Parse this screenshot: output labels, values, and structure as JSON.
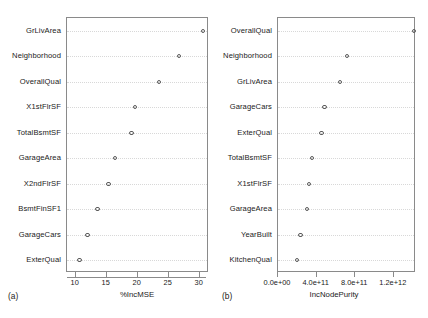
{
  "figure": {
    "background": "#ffffff",
    "marker_color": "#5a5a5a",
    "frame_color": "#8a8a8a",
    "guide_color": "#d8d8d8"
  },
  "panels": [
    {
      "tag": "(a)",
      "xlabel": "%IncMSE",
      "xticks": [
        "10",
        "15",
        "20",
        "25",
        "30"
      ]
    },
    {
      "tag": "(b)",
      "xlabel": "IncNodePurity",
      "xticks": [
        "0.0e+00",
        "4.0e+11",
        "8.0e+11",
        "1.2e+12"
      ]
    }
  ],
  "chart_data": [
    {
      "type": "scatter",
      "title": "(a)",
      "xlabel": "%IncMSE",
      "ylabel": "",
      "xlim": [
        8.6,
        31.5
      ],
      "xticks": [
        10,
        15,
        20,
        25,
        30
      ],
      "xticklabels": [
        "10",
        "15",
        "20",
        "25",
        "30"
      ],
      "grid": "dotted-horizontal",
      "legend": "none",
      "orientation": "horizontal-dotchart",
      "categories": [
        "GrLivArea",
        "Neighborhood",
        "OverallQual",
        "X1stFlrSF",
        "TotalBsmtSF",
        "GarageArea",
        "X2ndFlrSF",
        "BsmtFinSF1",
        "GarageCars",
        "ExterQual"
      ],
      "values": [
        30.5,
        26.7,
        23.4,
        19.6,
        19.0,
        16.3,
        15.3,
        13.5,
        11.9,
        10.6
      ]
    },
    {
      "type": "scatter",
      "title": "(b)",
      "xlabel": "IncNodePurity",
      "ylabel": "",
      "xlim": [
        0,
        1430000000000
      ],
      "xticks": [
        0,
        400000000000,
        800000000000,
        1200000000000
      ],
      "xticklabels": [
        "0.0e+00",
        "4.0e+11",
        "8.0e+11",
        "1.2e+12"
      ],
      "grid": "dotted-horizontal",
      "legend": "none",
      "orientation": "horizontal-dotchart",
      "categories": [
        "OverallQual",
        "Neighborhood",
        "GrLivArea",
        "GarageCars",
        "ExterQual",
        "TotalBsmtSF",
        "X1stFlrSF",
        "GarageArea",
        "YearBuilt",
        "KitchenQual"
      ],
      "values": [
        1410000000000,
        715000000000,
        640000000000,
        480000000000,
        450000000000,
        355000000000,
        320000000000,
        300000000000,
        235000000000,
        195000000000
      ]
    }
  ]
}
